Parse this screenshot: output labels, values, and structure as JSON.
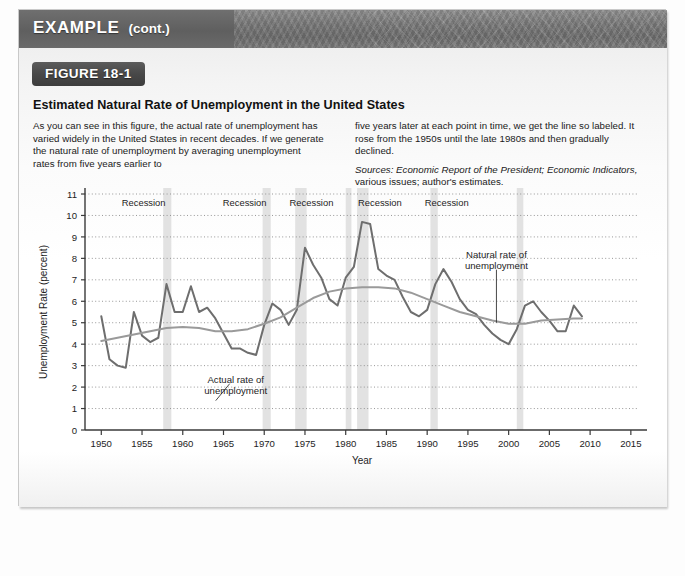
{
  "header": {
    "example_label": "EXAMPLE",
    "cont_label": "(cont.)"
  },
  "figure": {
    "badge": "FIGURE 18-1",
    "title": "Estimated Natural Rate of Unemployment in the United States",
    "body_left": "As you can see in this figure, the actual rate of unemployment has varied widely in the United States in recent decades. If we generate the natural rate of unemployment by averaging unemployment rates from five years earlier to",
    "body_right": "five years later at each point in time, we get the line so labeled. It rose from the 1950s until the late 1980s and then gradually declined.",
    "sources_label": "Sources:",
    "sources_italic": "Economic Report of the President; Economic Indicators,",
    "sources_rest": " various issues; author's estimates."
  },
  "colors": {
    "actual_line": "#6e6e6e",
    "natural_line": "#9a9a9a",
    "recession_band": "#e2e2e2",
    "axis": "#3a3a3a",
    "grid": "#8c8c8c",
    "header_bar": "#737373",
    "badge": "#474747"
  },
  "chart_data": {
    "type": "line",
    "title": "Estimated Natural Rate of Unemployment in the United States",
    "xlabel": "Year",
    "ylabel": "Unemployment Rate (percent)",
    "xlim": [
      1948,
      2016
    ],
    "ylim": [
      0,
      11
    ],
    "ytick_labels": [
      "0",
      "1",
      "2",
      "3",
      "4",
      "5",
      "6",
      "7",
      "8",
      "9",
      "10",
      "11"
    ],
    "yticks": [
      0,
      1,
      2,
      3,
      4,
      5,
      6,
      7,
      8,
      9,
      10,
      11
    ],
    "xticks": [
      1950,
      1955,
      1960,
      1965,
      1970,
      1975,
      1980,
      1985,
      1990,
      1995,
      2000,
      2005,
      2010,
      2015
    ],
    "xtick_labels": [
      "1950",
      "1955",
      "1960",
      "1965",
      "1970",
      "1975",
      "1980",
      "1985",
      "1990",
      "1995",
      "2000",
      "2005",
      "2010",
      "2015"
    ],
    "grid": "horizontal-dotted",
    "legend": "inline-annotations",
    "annotations": [
      {
        "name": "actual-rate-annotation",
        "text_line1": "Actual rate of",
        "text_line2": "unemployment",
        "x": 1966.5,
        "y": 2.3
      },
      {
        "name": "natural-rate-annotation",
        "text_line1": "Natural rate of",
        "text_line2": "unemployment",
        "x": 1998.5,
        "y": 7.1
      }
    ],
    "recession_label": "Recession",
    "recession_bands": [
      {
        "label": "Recession",
        "start": 1957.6,
        "end": 1958.6,
        "label_x": 1955.2
      },
      {
        "label": "Recession",
        "start": 1969.8,
        "end": 1970.8,
        "label_x": 1967.6
      },
      {
        "label": "Recession",
        "start": 1973.8,
        "end": 1975.2,
        "label_x": 1975.8
      },
      {
        "label": "Recession",
        "start": 1980.0,
        "end": 1980.7,
        "label_x": 1984.2
      },
      {
        "label": "Recession",
        "start": 1981.4,
        "end": 1982.8,
        "label_x": 1984.2
      },
      {
        "label": "Recession",
        "start": 1990.4,
        "end": 1991.3,
        "label_x": 1992.4
      },
      {
        "label": "Recession",
        "start": 2001.0,
        "end": 2001.8,
        "label_x": 2002.2
      }
    ],
    "recession_label_positions": [
      1955.2,
      1967.6,
      1975.8,
      1984.2,
      1992.4
    ],
    "series": [
      {
        "name": "Actual rate of unemployment",
        "color": "#6e6e6e",
        "x": [
          1950,
          1951,
          1952,
          1953,
          1954,
          1955,
          1956,
          1957,
          1958,
          1959,
          1960,
          1961,
          1962,
          1963,
          1964,
          1965,
          1966,
          1967,
          1968,
          1969,
          1970,
          1971,
          1972,
          1973,
          1974,
          1975,
          1976,
          1977,
          1978,
          1979,
          1980,
          1981,
          1982,
          1983,
          1984,
          1985,
          1986,
          1987,
          1988,
          1989,
          1990,
          1991,
          1992,
          1993,
          1994,
          1995,
          1996,
          1997,
          1998,
          1999,
          2000,
          2001,
          2002,
          2003,
          2004,
          2005,
          2006,
          2007,
          2008,
          2009
        ],
        "values": [
          5.3,
          3.3,
          3.0,
          2.9,
          5.5,
          4.4,
          4.1,
          4.3,
          6.8,
          5.5,
          5.5,
          6.7,
          5.5,
          5.7,
          5.2,
          4.5,
          3.8,
          3.8,
          3.6,
          3.5,
          4.9,
          5.9,
          5.6,
          4.9,
          5.6,
          8.5,
          7.7,
          7.1,
          6.1,
          5.8,
          7.1,
          7.6,
          9.7,
          9.6,
          7.5,
          7.2,
          7.0,
          6.2,
          5.5,
          5.3,
          5.6,
          6.8,
          7.5,
          6.9,
          6.1,
          5.6,
          5.4,
          4.9,
          4.5,
          4.2,
          4.0,
          4.7,
          5.8,
          6.0,
          5.5,
          5.1,
          4.6,
          4.6,
          5.8,
          5.3
        ]
      },
      {
        "name": "Natural rate of unemployment",
        "color": "#9a9a9a",
        "x": [
          1950,
          1952,
          1954,
          1956,
          1958,
          1960,
          1962,
          1964,
          1966,
          1968,
          1970,
          1972,
          1974,
          1976,
          1978,
          1980,
          1982,
          1984,
          1986,
          1988,
          1990,
          1992,
          1994,
          1996,
          1998,
          2000,
          2002,
          2004,
          2006,
          2008,
          2009
        ],
        "values": [
          4.15,
          4.3,
          4.45,
          4.6,
          4.75,
          4.8,
          4.75,
          4.6,
          4.6,
          4.7,
          4.95,
          5.25,
          5.7,
          6.15,
          6.45,
          6.6,
          6.65,
          6.65,
          6.6,
          6.4,
          6.1,
          5.8,
          5.5,
          5.3,
          5.1,
          4.95,
          4.95,
          5.1,
          5.15,
          5.2,
          5.2
        ]
      }
    ]
  }
}
